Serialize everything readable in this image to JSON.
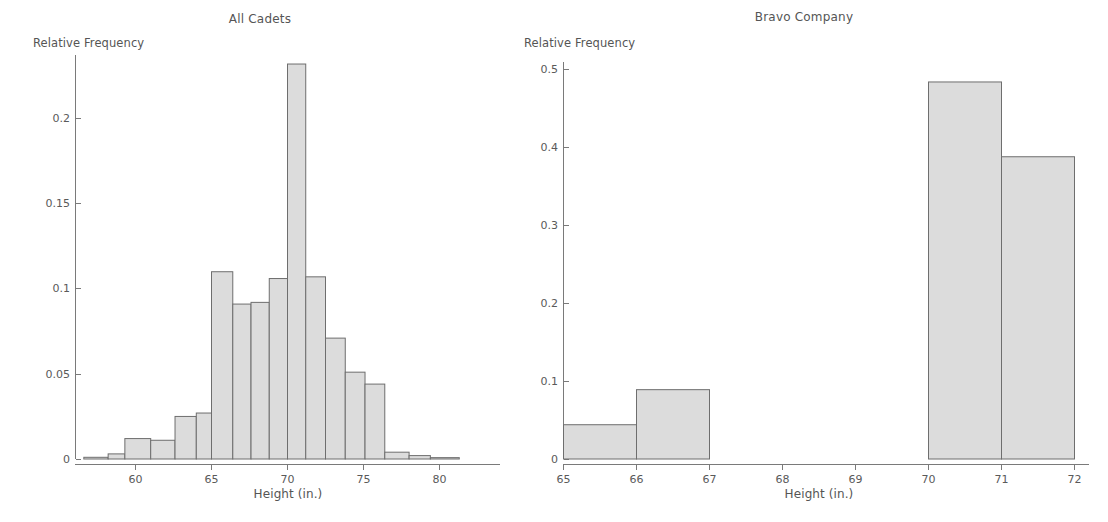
{
  "figure": {
    "width": 1108,
    "height": 522,
    "background": "#ffffff",
    "bar_fill": "#dcdcdc",
    "bar_stroke": "#6e6e6e",
    "axis_color": "#7a7a7a"
  },
  "panels": [
    {
      "id": "all-cadets",
      "title": "All Cadets",
      "ylabel": "Relative Frequency",
      "xlabel": "Height (in.)"
    },
    {
      "id": "bravo-company",
      "title": "Bravo Company",
      "ylabel": "Relative Frequency",
      "xlabel": "Height (in.)"
    }
  ],
  "chart_data": [
    {
      "type": "bar",
      "title": "All Cadets",
      "xlabel": "Height (in.)",
      "ylabel": "Relative Frequency",
      "xlim": [
        56.6,
        81.5
      ],
      "ylim": [
        0,
        0.245
      ],
      "grid": false,
      "legend": false,
      "xticks": [
        60,
        65,
        70,
        75,
        80
      ],
      "xticklabels": [
        "60",
        "65",
        "70",
        "75",
        "80"
      ],
      "yticks": [
        0,
        0.05,
        0.1,
        0.15,
        0.2
      ],
      "yticklabels": [
        "0",
        "0.05",
        "0.1",
        "0.15",
        "0.2"
      ],
      "bin_width": 2,
      "bin_edges": [
        57,
        59,
        61,
        63,
        65,
        67,
        69,
        71,
        73,
        75,
        77,
        79,
        81
      ],
      "categories": [
        "57-59",
        "59-61",
        "61-63",
        "63-65",
        "65-67",
        "67-69",
        "69-71",
        "71-73",
        "73-75",
        "75-77",
        "77-79",
        "79-81"
      ],
      "values": [
        0.003,
        0.012,
        0.011,
        0.025,
        0.027,
        0.11,
        0.091,
        0.092,
        0.106,
        0.232,
        0.107,
        0.071,
        0.051,
        0.044,
        0.004,
        0.002
      ]
    },
    {
      "type": "bar",
      "title": "Bravo Company",
      "xlabel": "Height (in.)",
      "ylabel": "Relative Frequency",
      "xlim": [
        65,
        72
      ],
      "ylim": [
        0,
        0.52
      ],
      "grid": false,
      "legend": false,
      "xticks": [
        65,
        66,
        67,
        68,
        69,
        70,
        71,
        72
      ],
      "xticklabels": [
        "65",
        "66",
        "67",
        "68",
        "69",
        "70",
        "71",
        "72"
      ],
      "yticks": [
        0,
        0.1,
        0.2,
        0.3,
        0.4,
        0.5
      ],
      "yticklabels": [
        "0",
        "0.1",
        "0.2",
        "0.3",
        "0.4",
        "0.5"
      ],
      "bin_width": 1,
      "bins": [
        {
          "x0": 65,
          "x1": 66,
          "value": 0.044
        },
        {
          "x0": 66,
          "x1": 67,
          "value": 0.089
        },
        {
          "x0": 67,
          "x1": 68,
          "value": 0
        },
        {
          "x0": 68,
          "x1": 69,
          "value": 0
        },
        {
          "x0": 69,
          "x1": 70,
          "value": 0
        },
        {
          "x0": 70,
          "x1": 71,
          "value": 0.484
        },
        {
          "x0": 71,
          "x1": 72,
          "value": 0.388
        }
      ],
      "categories": [
        "65-66",
        "66-67",
        "67-68",
        "68-69",
        "69-70",
        "70-71",
        "71-72"
      ],
      "values": [
        0.044,
        0.089,
        0,
        0,
        0,
        0.484,
        0.388
      ]
    }
  ],
  "left_bars": [
    {
      "x0": 56.6,
      "x1": 58.2,
      "value": 0.001
    },
    {
      "x0": 58.2,
      "x1": 59.3,
      "value": 0.003
    },
    {
      "x0": 59.3,
      "x1": 61.0,
      "value": 0.012
    },
    {
      "x0": 61.0,
      "x1": 62.6,
      "value": 0.011
    },
    {
      "x0": 62.6,
      "x1": 64.0,
      "value": 0.025
    },
    {
      "x0": 64.0,
      "x1": 65.0,
      "value": 0.027
    },
    {
      "x0": 65.0,
      "x1": 66.4,
      "value": 0.11
    },
    {
      "x0": 66.4,
      "x1": 67.6,
      "value": 0.091
    },
    {
      "x0": 67.6,
      "x1": 68.8,
      "value": 0.092
    },
    {
      "x0": 68.8,
      "x1": 70.0,
      "value": 0.106
    },
    {
      "x0": 70.0,
      "x1": 71.2,
      "value": 0.232
    },
    {
      "x0": 71.2,
      "x1": 72.5,
      "value": 0.107
    },
    {
      "x0": 72.5,
      "x1": 73.8,
      "value": 0.071
    },
    {
      "x0": 73.8,
      "x1": 75.1,
      "value": 0.051
    },
    {
      "x0": 75.1,
      "x1": 76.4,
      "value": 0.044
    },
    {
      "x0": 76.4,
      "x1": 78.0,
      "value": 0.004
    },
    {
      "x0": 78.0,
      "x1": 79.4,
      "value": 0.002
    },
    {
      "x0": 79.4,
      "x1": 81.3,
      "value": 0.0008
    }
  ]
}
